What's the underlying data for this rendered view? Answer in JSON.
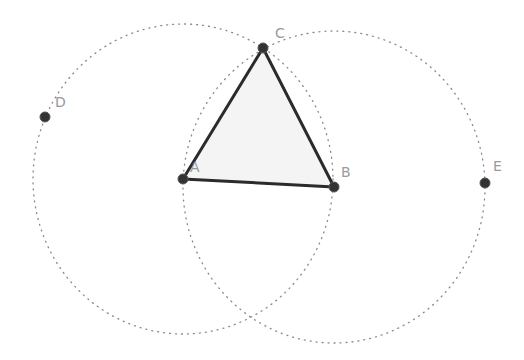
{
  "diagram": {
    "colors": {
      "background": "#ffffff",
      "segment": "#2b2b2b",
      "point": "#333333",
      "circle": "#8a8a8a",
      "label": "#9a9a9a",
      "fill": "#f4f4f4"
    },
    "points": [
      {
        "name": "A",
        "x": 183,
        "y": 179,
        "label_x": 190,
        "label_y": 172
      },
      {
        "name": "B",
        "x": 334,
        "y": 187,
        "label_x": 341,
        "label_y": 177
      },
      {
        "name": "C",
        "x": 263,
        "y": 48,
        "label_x": 275,
        "label_y": 38
      },
      {
        "name": "D",
        "x": 45,
        "y": 117,
        "label_x": 55,
        "label_y": 107
      },
      {
        "name": "E",
        "x": 485,
        "y": 183,
        "label_x": 493,
        "label_y": 171
      }
    ],
    "segments": [
      {
        "from": "A",
        "to": "B"
      },
      {
        "from": "B",
        "to": "C"
      },
      {
        "from": "C",
        "to": "A"
      }
    ],
    "circles": [
      {
        "name": "circle-centered-A",
        "center": "A",
        "cx": 183,
        "cy": 179,
        "rx": 150,
        "ry": 155
      },
      {
        "name": "circle-centered-B",
        "center": "B",
        "cx": 334,
        "cy": 187,
        "rx": 151,
        "ry": 156
      }
    ],
    "polygon": {
      "name": "triangle-ABC",
      "vertices": [
        "A",
        "B",
        "C"
      ]
    }
  }
}
